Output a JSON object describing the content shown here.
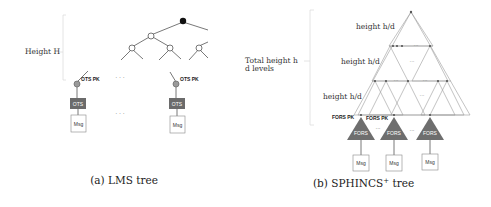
{
  "lms": {
    "height_label": "Height H",
    "ots_pk_label": "OTS PK",
    "ots_label": "OTS",
    "msg_label": "Msg",
    "ellipsis": "· · ·",
    "caption": "(a) LMS tree"
  },
  "sphincs": {
    "total_height_line1": "Total height h",
    "total_height_line2": "d levels",
    "layer_labels": [
      "height h/d",
      "height h/d",
      "height h/d"
    ],
    "fors_pk_label": "FORS PK",
    "fors_label": "FORS",
    "msg_label": "Msg",
    "ellipsis": "···",
    "caption_main": "(b) SPHINCS",
    "caption_sup": "+",
    "caption_tail": " tree"
  },
  "colors": {
    "root_node": "#111111",
    "ots_node": "#9a9a9a",
    "ots_box": "#6b6b6b",
    "fors_triangle": "#6e6e6e",
    "lines": "#555555"
  }
}
